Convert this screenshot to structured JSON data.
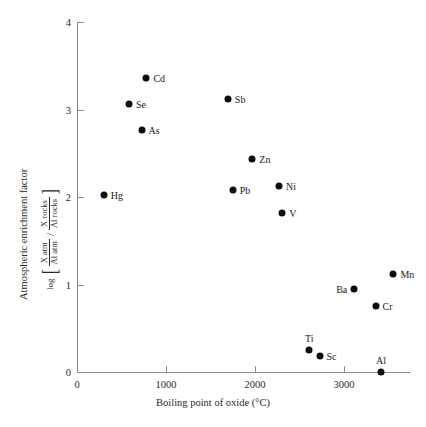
{
  "chart_data": {
    "type": "scatter",
    "title": "",
    "xlabel": "Boiling point of oxide (°C)",
    "ylabel_line1": "Atmospheric enrichment factor",
    "ylabel_formula": {
      "log": "log",
      "bracket_left": "[",
      "bracket_right": "]",
      "numerator_fraction": {
        "top": "X atm",
        "bottom": "Al atm"
      },
      "divider": "/",
      "denominator_fraction": {
        "top": "X rocks",
        "bottom": "Al rocks"
      }
    },
    "xlim": [
      0,
      3840
    ],
    "ylim": [
      0,
      4
    ],
    "xticks": [
      0,
      1000,
      2000,
      3000
    ],
    "xticklabels": [
      "0",
      "1000",
      "2000",
      "3000"
    ],
    "yticks": [
      0,
      1,
      2,
      3,
      4
    ],
    "yticklabels": [
      "0",
      "1",
      "2",
      "3",
      "4"
    ],
    "grid": false,
    "legend": "none",
    "marker": "filled-circle",
    "marker_color": "#0d0d0d",
    "axis_color": "#8a8a8a",
    "background": "#ffffff",
    "points": [
      {
        "label": "Cd",
        "x": 780,
        "y": 3.36,
        "label_pos": "right"
      },
      {
        "label": "Se",
        "x": 585,
        "y": 3.06,
        "label_pos": "right"
      },
      {
        "label": "As",
        "x": 725,
        "y": 2.77,
        "label_pos": "right"
      },
      {
        "label": "Hg",
        "x": 300,
        "y": 2.02,
        "label_pos": "right"
      },
      {
        "label": "Sb",
        "x": 1695,
        "y": 3.12,
        "label_pos": "right"
      },
      {
        "label": "Zn",
        "x": 1970,
        "y": 2.43,
        "label_pos": "right"
      },
      {
        "label": "Pb",
        "x": 1750,
        "y": 2.08,
        "label_pos": "right"
      },
      {
        "label": "Ni",
        "x": 2270,
        "y": 2.13,
        "label_pos": "right"
      },
      {
        "label": "V",
        "x": 2305,
        "y": 1.82,
        "label_pos": "right"
      },
      {
        "label": "Mn",
        "x": 3555,
        "y": 1.12,
        "label_pos": "right"
      },
      {
        "label": "Ba",
        "x": 3115,
        "y": 0.95,
        "label_pos": "left"
      },
      {
        "label": "Cr",
        "x": 3355,
        "y": 0.75,
        "label_pos": "right"
      },
      {
        "label": "Ti",
        "x": 2610,
        "y": 0.25,
        "label_pos": "above"
      },
      {
        "label": "Sc",
        "x": 2725,
        "y": 0.18,
        "label_pos": "right"
      },
      {
        "label": "Al",
        "x": 3415,
        "y": 0.0,
        "label_pos": "above"
      }
    ]
  }
}
